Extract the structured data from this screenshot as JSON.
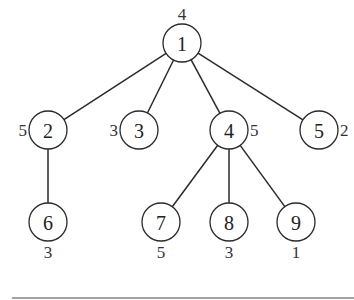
{
  "diagram": {
    "type": "tree",
    "nodes": [
      {
        "id": "1",
        "label": "1",
        "x": 182,
        "y": 43,
        "weight": "4",
        "weight_pos": "top"
      },
      {
        "id": "2",
        "label": "2",
        "x": 48,
        "y": 130,
        "weight": "5",
        "weight_pos": "left"
      },
      {
        "id": "3",
        "label": "3",
        "x": 139,
        "y": 130,
        "weight": "3",
        "weight_pos": "left"
      },
      {
        "id": "4",
        "label": "4",
        "x": 229,
        "y": 130,
        "weight": "5",
        "weight_pos": "right"
      },
      {
        "id": "5",
        "label": "5",
        "x": 319,
        "y": 130,
        "weight": "2",
        "weight_pos": "right"
      },
      {
        "id": "6",
        "label": "6",
        "x": 48,
        "y": 222,
        "weight": "3",
        "weight_pos": "bottom"
      },
      {
        "id": "7",
        "label": "7",
        "x": 161,
        "y": 222,
        "weight": "5",
        "weight_pos": "bottom"
      },
      {
        "id": "8",
        "label": "8",
        "x": 229,
        "y": 222,
        "weight": "3",
        "weight_pos": "bottom"
      },
      {
        "id": "9",
        "label": "9",
        "x": 296,
        "y": 222,
        "weight": "1",
        "weight_pos": "bottom"
      }
    ],
    "edges": [
      {
        "from": "1",
        "to": "2"
      },
      {
        "from": "1",
        "to": "3"
      },
      {
        "from": "1",
        "to": "4"
      },
      {
        "from": "1",
        "to": "5"
      },
      {
        "from": "2",
        "to": "6"
      },
      {
        "from": "4",
        "to": "7"
      },
      {
        "from": "4",
        "to": "8"
      },
      {
        "from": "4",
        "to": "9"
      }
    ],
    "node_radius": 19,
    "colors": {
      "stroke": "#2a2a2a",
      "text": "#222222",
      "background": "#ffffff"
    }
  }
}
